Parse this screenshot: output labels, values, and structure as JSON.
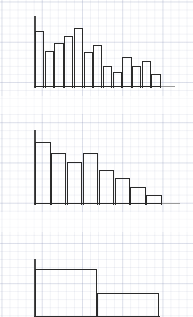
{
  "page": {
    "width": 193,
    "height": 317,
    "background_color": "#ffffff",
    "grid": {
      "minor_color": "#c8cde0",
      "minor_spacing_px": 8,
      "major_color": "#b6bcd6",
      "major_spacing_px": 40
    },
    "stroke_color": "#2b2b2b",
    "axis_color": "#4a4a4a"
  },
  "chart_data": [
    {
      "type": "bar",
      "name": "top-histogram",
      "title": "",
      "subtitle": "",
      "xlabel": "",
      "ylabel": "",
      "grid": true,
      "legend": "none",
      "bar_style": "outline",
      "categories": [
        "1",
        "2",
        "3",
        "4",
        "5",
        "6",
        "7",
        "8",
        "9",
        "10",
        "11",
        "12",
        "13"
      ],
      "values": [
        57,
        37,
        45,
        52,
        60,
        36,
        43,
        22,
        16,
        31,
        22,
        27,
        14
      ],
      "ylim": [
        0,
        72
      ],
      "origin": {
        "x": 35.0,
        "y": 87.5
      },
      "plot_width": 127,
      "plot_height": 72,
      "bar_width": 9.3,
      "bar_gap": 0.4,
      "axis_tail_length": 14
    },
    {
      "type": "bar",
      "name": "middle-histogram",
      "title": "",
      "subtitle": "",
      "xlabel": "",
      "ylabel": "",
      "grid": true,
      "legend": "none",
      "bar_style": "outline",
      "categories": [
        "1",
        "2",
        "3",
        "4",
        "5",
        "6",
        "7",
        "8"
      ],
      "values": [
        63,
        52,
        43,
        52,
        35,
        27,
        18,
        10
      ],
      "ylim": [
        0,
        75
      ],
      "origin": {
        "x": 35.0,
        "y": 204.5
      },
      "plot_width": 127,
      "plot_height": 75,
      "bar_width": 15.5,
      "bar_gap": 0.4,
      "axis_tail_length": 18
    },
    {
      "type": "bar",
      "name": "bottom-histogram",
      "title": "",
      "subtitle": "",
      "xlabel": "",
      "ylabel": "",
      "grid": true,
      "legend": "none",
      "bar_style": "outline",
      "categories": [
        "1",
        "2"
      ],
      "values": [
        48,
        24
      ],
      "ylim": [
        0,
        58
      ],
      "origin": {
        "x": 35.0,
        "y": 317.0
      },
      "plot_width": 124,
      "plot_height": 58,
      "bar_width": 62,
      "bar_gap": 0,
      "axis_tail_length": 0
    }
  ]
}
